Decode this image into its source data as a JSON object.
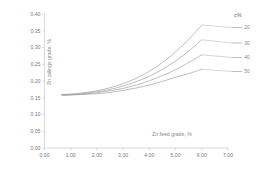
{
  "chart_data": {
    "type": "line",
    "title": "",
    "xlabel": "Zn feed grade, %",
    "ylabel": "Zn tailings grade, %",
    "xlim": [
      0.0,
      7.0
    ],
    "ylim": [
      0.0,
      0.4
    ],
    "xticks": [
      "0.00",
      "1.00",
      "2.00",
      "3.00",
      "4.00",
      "5.00",
      "6.00",
      "7.00"
    ],
    "xtick_values": [
      0.0,
      1.0,
      2.0,
      3.0,
      4.0,
      5.0,
      6.0,
      7.0
    ],
    "yticks": [
      "0.00",
      "0.05",
      "0.10",
      "0.15",
      "0.20",
      "0.25",
      "0.30",
      "0.35",
      "0.40"
    ],
    "ytick_values": [
      0.0,
      0.05,
      0.1,
      0.15,
      0.2,
      0.25,
      0.3,
      0.35,
      0.4
    ],
    "grid": false,
    "legend_title": "c%",
    "legend_position": "right",
    "x": [
      0.65,
      1.0,
      1.5,
      2.0,
      2.5,
      3.0,
      3.5,
      4.0,
      4.5,
      5.0,
      5.5,
      6.0
    ],
    "series": [
      {
        "name": "20",
        "label": "20",
        "color": "#9a9a9a",
        "values": [
          0.16,
          0.161,
          0.165,
          0.171,
          0.18,
          0.192,
          0.208,
          0.229,
          0.255,
          0.287,
          0.324,
          0.367
        ]
      },
      {
        "name": "30",
        "label": "30",
        "color": "#9a9a9a",
        "values": [
          0.159,
          0.16,
          0.163,
          0.168,
          0.175,
          0.185,
          0.198,
          0.214,
          0.235,
          0.26,
          0.289,
          0.323
        ]
      },
      {
        "name": "40",
        "label": "40",
        "color": "#9a9a9a",
        "values": [
          0.158,
          0.159,
          0.161,
          0.165,
          0.171,
          0.178,
          0.188,
          0.201,
          0.216,
          0.234,
          0.255,
          0.278
        ]
      },
      {
        "name": "50",
        "label": "50",
        "color": "#9a9a9a",
        "values": [
          0.157,
          0.158,
          0.16,
          0.162,
          0.166,
          0.172,
          0.179,
          0.188,
          0.199,
          0.211,
          0.222,
          0.235
        ]
      }
    ]
  },
  "legend": {
    "title": "c%",
    "entries": [
      {
        "label": "20"
      },
      {
        "label": "30"
      },
      {
        "label": "40"
      },
      {
        "label": "50"
      }
    ]
  },
  "axes": {
    "x_title": "Zn feed grade, %",
    "y_title": "Zn tailings grade, %"
  },
  "colors": {
    "background": "#ffffff",
    "axis": "#c8c8c8",
    "line": "#9a9a9a",
    "text": "#8a8a8a"
  }
}
